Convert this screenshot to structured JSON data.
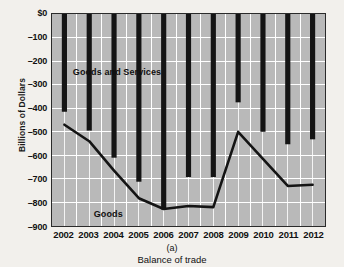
{
  "chart_data": {
    "type": "bar",
    "title": "",
    "subtitle": "Balance of trade",
    "panel_label": "(a)",
    "xlabel": "",
    "ylabel": "Billions of Dollars",
    "categories": [
      "2002",
      "2003",
      "2004",
      "2005",
      "2006",
      "2007",
      "2008",
      "2009",
      "2010",
      "2011",
      "2012"
    ],
    "ylim": [
      -900,
      0
    ],
    "ytick_labels": [
      "$0",
      "–100",
      "–200",
      "–300",
      "–400",
      "–500",
      "–600",
      "–700",
      "–800",
      "–900"
    ],
    "ytick_values": [
      0,
      -100,
      -200,
      -300,
      -400,
      -500,
      -600,
      -700,
      -800,
      -900
    ],
    "grid": true,
    "grid_color": "#ffffff",
    "plot_background": "#b9b9b9",
    "series": [
      {
        "name": "Goods and Services",
        "render": "bar",
        "color": "#141414",
        "values": [
          -415,
          -495,
          -610,
          -712,
          -830,
          -692,
          -692,
          -375,
          -500,
          -553,
          -532
        ]
      },
      {
        "name": "Goods",
        "render": "line",
        "color": "#141414",
        "values": [
          -470,
          -540,
          -665,
          -782,
          -828,
          -815,
          -820,
          -500,
          -615,
          -730,
          -725
        ]
      }
    ],
    "annotations": [
      {
        "text": "Goods and Services",
        "x": 2004.1,
        "y": -245
      },
      {
        "text": "Goods",
        "x": 2003.75,
        "y": -840
      }
    ]
  },
  "accessibility": {
    "figure_name": "balance-of-trade-chart"
  }
}
